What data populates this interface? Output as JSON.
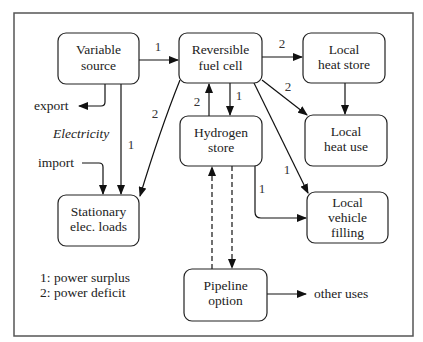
{
  "diagram": {
    "type": "flowchart",
    "nodes": {
      "variable_source": {
        "line1": "Variable",
        "line2": "source"
      },
      "fuel_cell": {
        "line1": "Reversible",
        "line2": "fuel cell"
      },
      "heat_store": {
        "line1": "Local",
        "line2": "heat store"
      },
      "heat_use": {
        "line1": "Local",
        "line2": "heat use"
      },
      "hydrogen_store": {
        "line1": "Hydrogen",
        "line2": "store"
      },
      "stationary_loads": {
        "line1": "Stationary",
        "line2": "elec. loads"
      },
      "vehicle_filling": {
        "line1": "Local",
        "line2": "vehicle",
        "line3": "filling"
      },
      "pipeline": {
        "line1": "Pipeline",
        "line2": "option"
      }
    },
    "labels": {
      "export": "export",
      "import": "import",
      "electricity": "Electricity",
      "other_uses": "other uses"
    },
    "edges": [
      {
        "from": "Variable source",
        "to": "Reversible fuel cell",
        "label": "1"
      },
      {
        "from": "Reversible fuel cell",
        "to": "Local heat store",
        "label": "2"
      },
      {
        "from": "Reversible fuel cell",
        "to": "Local heat use",
        "label": "2"
      },
      {
        "from": "Local heat store",
        "to": "Local heat use",
        "label": ""
      },
      {
        "from": "Reversible fuel cell",
        "to": "Hydrogen store",
        "label": "1"
      },
      {
        "from": "Hydrogen store",
        "to": "Reversible fuel cell",
        "label": "2"
      },
      {
        "from": "Reversible fuel cell",
        "to": "Stationary elec. loads",
        "label": "2"
      },
      {
        "from": "Variable source",
        "to": "Stationary elec. loads",
        "label": "1"
      },
      {
        "from": "Variable source",
        "to": "export",
        "label": ""
      },
      {
        "from": "import",
        "to": "Stationary elec. loads",
        "label": ""
      },
      {
        "from": "Reversible fuel cell",
        "to": "Local vehicle filling",
        "label": "1"
      },
      {
        "from": "Hydrogen store",
        "to": "Local vehicle filling",
        "label": "1"
      },
      {
        "from": "Pipeline option",
        "to": "Hydrogen store",
        "label": "",
        "style": "dashed"
      },
      {
        "from": "Hydrogen store",
        "to": "Pipeline option",
        "label": "",
        "style": "dashed"
      },
      {
        "from": "Pipeline option",
        "to": "other uses",
        "label": ""
      }
    ],
    "edge_labels": {
      "vs_fc": "1",
      "fc_hs": "2",
      "fc_hu": "2",
      "fc_h2": "1",
      "h2_fc": "2",
      "fc_sl": "2",
      "vs_sl": "1",
      "fc_vf": "1",
      "h2_vf": "1"
    },
    "legend": {
      "line1": "1: power surplus",
      "line2": "2: power deficit"
    }
  }
}
